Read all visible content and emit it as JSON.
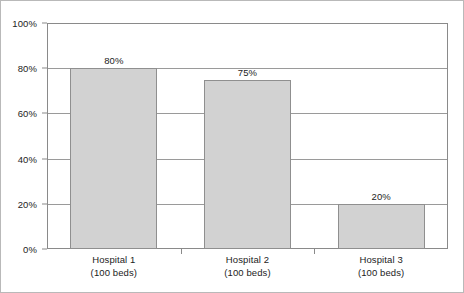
{
  "chart_data": {
    "type": "bar",
    "title": "",
    "subtitle": "",
    "xlabel": "",
    "ylabel": "",
    "categories": [
      "Hospital 1",
      "Hospital 2",
      "Hospital 3"
    ],
    "category_sublabels": [
      "(100 beds)",
      "(100 beds)",
      "(100 beds)"
    ],
    "values": [
      80,
      75,
      20
    ],
    "value_labels": [
      "80%",
      "75%",
      "20%"
    ],
    "ylim": [
      0,
      100
    ],
    "ytick_values": [
      0,
      20,
      40,
      60,
      80,
      100
    ],
    "ytick_labels": [
      "0%",
      "20%",
      "40%",
      "60%",
      "80%",
      "100%"
    ],
    "grid": true,
    "grid_axis": "y",
    "legend": false,
    "legend_position": "none",
    "bar_fill_color": "#d2d2d2",
    "bar_edge_color": "#8f8f8f",
    "gridline_color": "#9a9a9a",
    "axis_color": "#8a8a8a",
    "text_color": "#1c1c1c",
    "background_color": "#ffffff",
    "border_color": "#b9b9b9"
  }
}
